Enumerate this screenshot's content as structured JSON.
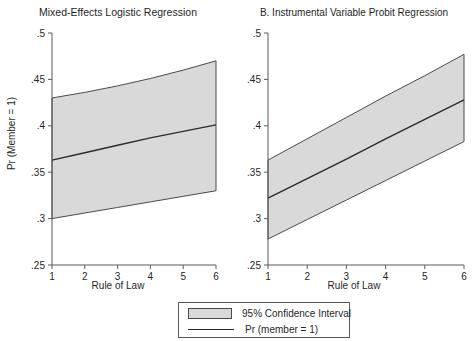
{
  "figure": {
    "y_axis_label": "Pr (Member = 1)",
    "x_axis_label": "Rule of Law"
  },
  "panels": [
    {
      "title": "Mixed-Effects Logistic Regression",
      "xlabel": "Rule of Law",
      "ylabel": "Pr (Member = 1)"
    },
    {
      "title": "B. Instrumental Variable Probit Regression",
      "xlabel": "Rule of Law",
      "ylabel": ""
    }
  ],
  "legend": {
    "ci_label": "95% Confidence Interval",
    "line_label": "Pr (member = 1)",
    "ci_swatch_color": "#d9d9d9",
    "line_color": "#2b2b2b"
  },
  "axis": {
    "y_ticks": [
      ".25",
      ".3",
      ".35",
      ".4",
      ".45",
      ".5"
    ],
    "y_tick_values": [
      0.25,
      0.3,
      0.35,
      0.4,
      0.45,
      0.5
    ],
    "x_ticks": [
      "1",
      "2",
      "3",
      "4",
      "5",
      "6"
    ],
    "x_tick_values": [
      1,
      2,
      3,
      4,
      5,
      6
    ],
    "ylim": [
      0.25,
      0.5
    ],
    "xlim": [
      1,
      6
    ]
  },
  "chart_data": [
    {
      "type": "line",
      "title": "Mixed-Effects Logistic Regression",
      "xlabel": "Rule of Law",
      "ylabel": "Pr (Member = 1)",
      "xlim": [
        1,
        6
      ],
      "ylim": [
        0.25,
        0.5
      ],
      "grid": false,
      "legend_position": "below-figure",
      "x": [
        1,
        2,
        3,
        4,
        5,
        6
      ],
      "series": [
        {
          "name": "Pr (member = 1)",
          "values": [
            0.363,
            0.371,
            0.379,
            0.387,
            0.394,
            0.401
          ]
        },
        {
          "name": "95% Confidence Interval upper",
          "values": [
            0.43,
            0.436,
            0.443,
            0.451,
            0.46,
            0.47
          ]
        },
        {
          "name": "95% Confidence Interval lower",
          "values": [
            0.3,
            0.306,
            0.312,
            0.318,
            0.324,
            0.33
          ]
        }
      ]
    },
    {
      "type": "line",
      "title": "B. Instrumental Variable Probit Regression",
      "xlabel": "Rule of Law",
      "ylabel": "",
      "xlim": [
        1,
        6
      ],
      "ylim": [
        0.25,
        0.5
      ],
      "grid": false,
      "legend_position": "below-figure",
      "x": [
        1,
        2,
        3,
        4,
        5,
        6
      ],
      "series": [
        {
          "name": "Pr (member = 1)",
          "values": [
            0.322,
            0.343,
            0.364,
            0.386,
            0.407,
            0.428
          ]
        },
        {
          "name": "95% Confidence Interval upper",
          "values": [
            0.363,
            0.386,
            0.409,
            0.432,
            0.454,
            0.477
          ]
        },
        {
          "name": "95% Confidence Interval lower",
          "values": [
            0.278,
            0.299,
            0.32,
            0.341,
            0.362,
            0.383
          ]
        }
      ]
    }
  ]
}
